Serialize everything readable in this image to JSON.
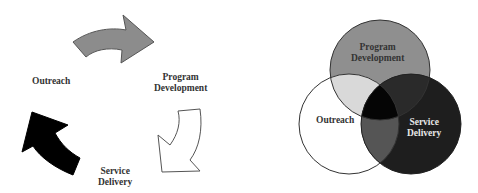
{
  "cycle_diagram": {
    "labels": {
      "outreach": "Outreach",
      "program_development": [
        "Program",
        "Development"
      ],
      "service_delivery": [
        "Service",
        "Delivery"
      ]
    },
    "arrows": [
      {
        "name": "outreach-to-program-arrow",
        "fill": "#8c8c8c"
      },
      {
        "name": "program-to-service-arrow",
        "fill": "#ffffff"
      },
      {
        "name": "service-to-outreach-arrow",
        "fill": "#000000"
      }
    ]
  },
  "venn_diagram": {
    "circles": [
      {
        "name": "program-development",
        "label": [
          "Program",
          "Development"
        ],
        "fill": "#8f8f8f"
      },
      {
        "name": "outreach",
        "label": [
          "Outreach"
        ],
        "fill": "#ffffff"
      },
      {
        "name": "service-delivery",
        "label": [
          "Service",
          "Delivery"
        ],
        "fill": "#1e1e1e"
      }
    ],
    "overlap_colors": {
      "program_outreach": "#d9d9d9",
      "program_service": "#2a2a2a",
      "outreach_service": "#555555",
      "all_three": "#050505"
    }
  }
}
